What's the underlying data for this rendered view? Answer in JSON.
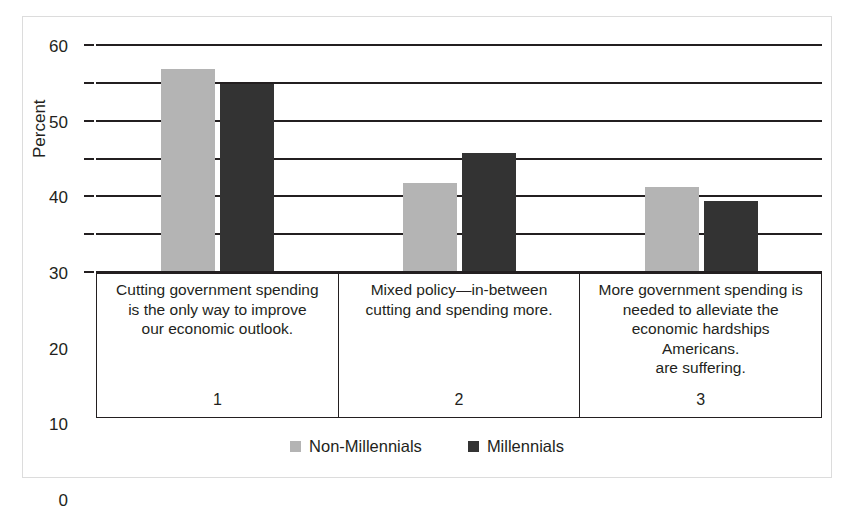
{
  "chart_data": {
    "type": "bar",
    "title": "",
    "xlabel": "",
    "ylabel": "Percent",
    "ylim": [
      0,
      60
    ],
    "yticks": [
      0,
      10,
      20,
      30,
      40,
      50,
      60
    ],
    "ytick_labels": [
      "0",
      "10",
      "20",
      "30",
      "40",
      "50",
      "60"
    ],
    "grid": true,
    "legend_position": "bottom-center",
    "categories": [
      "1",
      "2",
      "3"
    ],
    "category_labels": [
      "Cutting government spending is the only way to improve our economic outlook.",
      "Mixed policy—in-between cutting and spending more.",
      "More government spending is needed to alleviate the economic hardships Americans. are suffering."
    ],
    "category_label_lines": [
      [
        "Cutting government spending",
        "is the only way to improve",
        "our economic outlook."
      ],
      [
        "Mixed policy—in-between",
        "cutting and spending more."
      ],
      [
        "More government spending is",
        "needed to alleviate the",
        "economic hardships",
        "Americans.",
        "are suffering."
      ]
    ],
    "series": [
      {
        "name": "Non-Millennials",
        "color": "#b4b4b4",
        "values": [
          53.5,
          23.2,
          22.1
        ]
      },
      {
        "name": "Millennials",
        "color": "#333333",
        "values": [
          49.5,
          31.2,
          18.5
        ]
      }
    ]
  },
  "legend": {
    "entries": [
      {
        "label": "Non-Millennials",
        "swatch": "light-gray-square"
      },
      {
        "label": "Millennials",
        "swatch": "dark-gray-square"
      }
    ]
  },
  "axis": {
    "y_title": "Percent"
  },
  "colors": {
    "non_millennials": "#b4b4b4",
    "millennials": "#333333",
    "axis": "#231f20",
    "frame": "#dcdcdc",
    "background": "#ffffff"
  }
}
